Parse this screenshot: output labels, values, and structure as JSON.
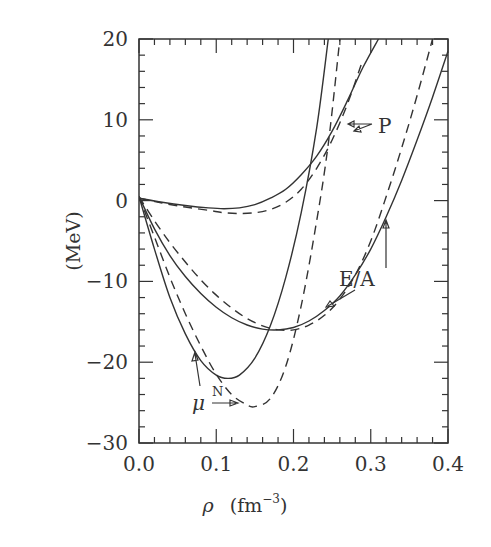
{
  "chart_data": {
    "type": "line",
    "title": "",
    "xlabel": "ρ (fm⁻³)",
    "xlabel_parts": {
      "symbol": "ρ",
      "unit": "(fm",
      "exp": "−3",
      "close": ")"
    },
    "ylabel": "(MeV)",
    "xlim": [
      0.0,
      0.4
    ],
    "ylim": [
      -30,
      20
    ],
    "xticks": [
      "0.0",
      "0.1",
      "0.2",
      "0.3",
      "0.4"
    ],
    "yticks": [
      "20",
      "10",
      "0",
      "−10",
      "−20",
      "−30"
    ],
    "grid": false,
    "legend": "none (curves labeled by annotations)",
    "annotations": [
      {
        "text": "P",
        "x": 0.3,
        "y": 9.5
      },
      {
        "text": "E/A",
        "x": 0.33,
        "y": -11
      },
      {
        "text": "μ",
        "sup": "N",
        "x": 0.075,
        "y": -25
      }
    ],
    "series": [
      {
        "name": "μ^N (solid)",
        "style": "solid",
        "x": [
          0.0,
          0.02,
          0.04,
          0.06,
          0.08,
          0.1,
          0.115,
          0.13,
          0.15,
          0.17,
          0.19,
          0.21,
          0.23,
          0.245
        ],
        "y": [
          0.5,
          -6,
          -12,
          -16.5,
          -19.8,
          -21.6,
          -22,
          -21.6,
          -19.5,
          -15.5,
          -9.5,
          -1.5,
          9,
          20
        ]
      },
      {
        "name": "μ^N (dashed)",
        "style": "dashed",
        "x": [
          0.0,
          0.02,
          0.04,
          0.06,
          0.08,
          0.1,
          0.12,
          0.14,
          0.15,
          0.17,
          0.19,
          0.21,
          0.23,
          0.245,
          0.26
        ],
        "y": [
          0.5,
          -4.5,
          -9.5,
          -14,
          -18,
          -21.5,
          -24,
          -25.3,
          -25.5,
          -24.5,
          -20.5,
          -13,
          -2.5,
          7,
          20
        ]
      },
      {
        "name": "E/A (solid)",
        "style": "solid",
        "x": [
          0.0,
          0.02,
          0.04,
          0.06,
          0.08,
          0.1,
          0.12,
          0.14,
          0.16,
          0.18,
          0.2,
          0.22,
          0.24,
          0.26,
          0.28,
          0.3,
          0.32,
          0.34,
          0.36,
          0.38,
          0.4
        ],
        "y": [
          0.5,
          -3.5,
          -6.8,
          -9.4,
          -11.5,
          -13.2,
          -14.5,
          -15.4,
          -15.9,
          -16,
          -15.7,
          -14.9,
          -13.6,
          -11.8,
          -9.2,
          -6,
          -2,
          2.5,
          7.5,
          12.8,
          18.5
        ]
      },
      {
        "name": "E/A (dashed)",
        "style": "dashed",
        "x": [
          0.0,
          0.02,
          0.04,
          0.06,
          0.08,
          0.1,
          0.12,
          0.14,
          0.16,
          0.18,
          0.2,
          0.22,
          0.24,
          0.26,
          0.28,
          0.3,
          0.32,
          0.34,
          0.36,
          0.38
        ],
        "y": [
          0.5,
          -2.5,
          -5.2,
          -7.6,
          -9.8,
          -11.7,
          -13.3,
          -14.6,
          -15.5,
          -16,
          -16,
          -15.4,
          -14.2,
          -12.2,
          -9.2,
          -5,
          0.5,
          6.5,
          13,
          20
        ]
      },
      {
        "name": "P (solid)",
        "style": "solid",
        "x": [
          0.0,
          0.03,
          0.06,
          0.09,
          0.11,
          0.13,
          0.15,
          0.17,
          0.19,
          0.21,
          0.23,
          0.25,
          0.27,
          0.29,
          0.31
        ],
        "y": [
          0.3,
          -0.2,
          -0.6,
          -0.9,
          -1,
          -0.9,
          -0.5,
          0.3,
          1.4,
          3.2,
          5.5,
          8.6,
          12.4,
          16.5,
          20
        ]
      },
      {
        "name": "P (dashed)",
        "style": "dashed",
        "x": [
          0.0,
          0.03,
          0.06,
          0.09,
          0.11,
          0.13,
          0.15,
          0.17,
          0.19,
          0.21,
          0.23,
          0.25,
          0.27,
          0.29
        ],
        "y": [
          0.3,
          -0.3,
          -0.8,
          -1.2,
          -1.5,
          -1.6,
          -1.5,
          -1.1,
          -0.2,
          1.4,
          4,
          7.5,
          12,
          17.5
        ]
      }
    ]
  }
}
